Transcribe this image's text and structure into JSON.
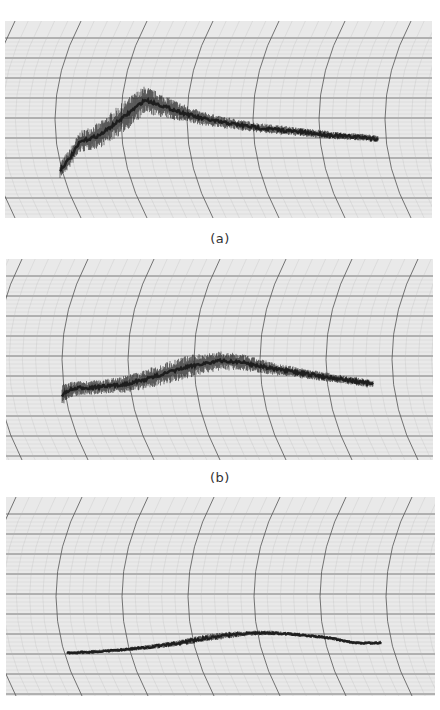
{
  "figure": {
    "captions": [
      "(a)",
      "(b)"
    ],
    "paper_color": "#e9e9e9",
    "major_grid_color": "#555555",
    "minor_grid_color": "#b4b4b4",
    "trace_color": "#1e1e1e"
  },
  "chart_data": [
    {
      "type": "line",
      "label": "(a)",
      "title": "",
      "xlabel": "",
      "ylabel": "",
      "grid": true,
      "grid_style": "strip-chart recorder paper with curved time arcs",
      "panel_box": {
        "x": 5,
        "y": 21,
        "w": 427,
        "h": 197
      },
      "noise": "heavy, band ~30px early narrowing to ~6px at end",
      "x": [
        60,
        70,
        80,
        100,
        120,
        135,
        145,
        160,
        180,
        200,
        220,
        240,
        260,
        280,
        300,
        320,
        340,
        360,
        378
      ],
      "y": [
        170,
        158,
        142,
        135,
        120,
        108,
        100,
        105,
        112,
        118,
        122,
        125,
        128,
        130,
        132,
        134,
        136,
        137,
        139
      ],
      "band": [
        14,
        16,
        18,
        22,
        26,
        26,
        24,
        20,
        16,
        12,
        10,
        9,
        8,
        8,
        7,
        7,
        6,
        6,
        6
      ]
    },
    {
      "type": "line",
      "label": "(b)",
      "title": "",
      "xlabel": "",
      "ylabel": "",
      "grid": true,
      "grid_style": "strip-chart recorder paper with curved time arcs",
      "panel_box": {
        "x": 6,
        "y": 259,
        "w": 427,
        "h": 201
      },
      "noise": "moderate-heavy, band ~20px through middle narrowing to ~6px at end",
      "x": [
        62,
        70,
        80,
        100,
        120,
        140,
        160,
        180,
        200,
        220,
        240,
        260,
        280,
        300,
        320,
        340,
        360,
        373
      ],
      "y": [
        395,
        390,
        388,
        387,
        385,
        381,
        375,
        369,
        364,
        361,
        362,
        366,
        370,
        373,
        376,
        379,
        382,
        384
      ],
      "band": [
        18,
        14,
        12,
        12,
        14,
        16,
        18,
        20,
        18,
        16,
        14,
        12,
        10,
        9,
        8,
        7,
        7,
        6
      ]
    },
    {
      "type": "line",
      "label": "(c)",
      "title": "",
      "xlabel": "",
      "ylabel": "",
      "grid": true,
      "grid_style": "strip-chart recorder paper with curved time arcs",
      "panel_box": {
        "x": 6,
        "y": 497,
        "w": 429,
        "h": 199
      },
      "noise": "low, thin band ~3-5px",
      "x": [
        67,
        90,
        120,
        150,
        180,
        200,
        220,
        240,
        255,
        270,
        290,
        310,
        330,
        345,
        355,
        381
      ],
      "y": [
        653,
        652,
        650,
        647,
        643,
        639,
        636,
        634,
        633,
        633,
        634,
        636,
        638,
        641,
        643,
        643
      ],
      "band": [
        3,
        3,
        3,
        4,
        5,
        6,
        6,
        5,
        4,
        4,
        3,
        3,
        3,
        3,
        3,
        3
      ]
    }
  ]
}
